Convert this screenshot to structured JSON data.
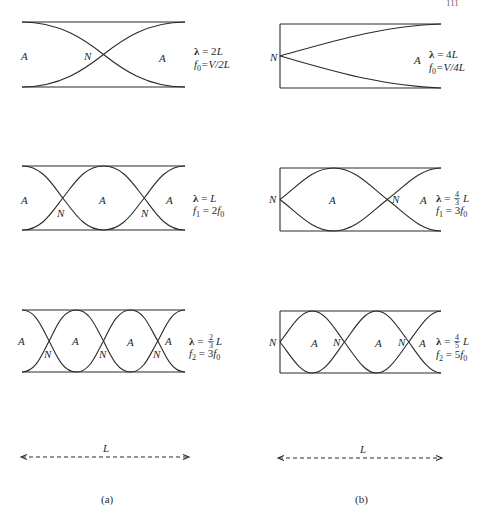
{
  "page_number": "111",
  "panels": [
    {
      "id": "a",
      "caption": "(a)",
      "tube_type": "open-open",
      "length_label": "L",
      "modes": [
        {
          "labels": [
            "A",
            "N",
            "A"
          ],
          "lambda": "λ = 2L",
          "lambda_parts": {
            "sym": "λ",
            "eq": " = 2",
            "var": "L"
          },
          "freq_parts": {
            "f": "f",
            "sub": "0",
            "eq": "=V/2",
            "var": "L"
          }
        },
        {
          "labels": [
            "A",
            "N",
            "A",
            "N",
            "A"
          ],
          "lambda_parts": {
            "sym": "λ",
            "eq": " = ",
            "var": "L"
          },
          "freq_parts": {
            "f": "f",
            "sub": "1",
            "eq": " = 2",
            "f2": "f",
            "sub2": "0"
          }
        },
        {
          "labels": [
            "A",
            "N",
            "A",
            "N",
            "A",
            "N",
            "A"
          ],
          "lambda_parts": {
            "sym": "λ",
            "eq": " = ",
            "num": "2",
            "den": "3",
            "var": "L"
          },
          "freq_parts": {
            "f": "f",
            "sub": "2",
            "eq": " = 3",
            "f2": "f",
            "sub2": "0"
          }
        }
      ]
    },
    {
      "id": "b",
      "caption": "(b)",
      "tube_type": "closed-open",
      "length_label": "L",
      "modes": [
        {
          "labels": [
            "N",
            "A"
          ],
          "lambda_parts": {
            "sym": "λ",
            "eq": " = 4",
            "var": "L"
          },
          "freq_parts": {
            "f": "f",
            "sub": "0",
            "eq": "=V/4",
            "var": "L"
          }
        },
        {
          "labels": [
            "N",
            "A",
            "N",
            "A"
          ],
          "lambda_parts": {
            "sym": "λ",
            "eq": " = ",
            "num": "4",
            "den": "3",
            "var": "L"
          },
          "freq_parts": {
            "f": "f",
            "sub": "1",
            "eq": " = 3",
            "f2": "f",
            "sub2": "0"
          }
        },
        {
          "labels": [
            "N",
            "A",
            "N",
            "A",
            "N",
            "A"
          ],
          "lambda_parts": {
            "sym": "λ",
            "eq": " = ",
            "num": "4",
            "den": "5",
            "var": "L"
          },
          "freq_parts": {
            "f": "f",
            "sub": "2",
            "eq": " = 5",
            "f2": "f",
            "sub2": "0"
          }
        }
      ]
    }
  ],
  "colors": {
    "ink": "#2a2a2a",
    "background": "#ffffff"
  }
}
